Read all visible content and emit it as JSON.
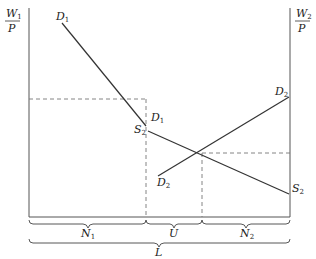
{
  "diagram": {
    "left_axis_label": {
      "num": "W",
      "num_sub": "1",
      "den": "P"
    },
    "right_axis_label": {
      "num": "W",
      "num_sub": "2",
      "den": "P"
    },
    "curves": [
      {
        "name": "D",
        "sub": "1",
        "label_top": "D1",
        "label_bottom": "D1"
      },
      {
        "name": "S",
        "sub": "2",
        "label_left": "S2",
        "label_right": "S2"
      },
      {
        "name": "D",
        "sub": "2",
        "label_left": "D2",
        "label_right": "D2"
      }
    ],
    "segments": {
      "n1": {
        "name": "N",
        "sub": "1"
      },
      "u": {
        "name": "U"
      },
      "n2": {
        "name": "N",
        "sub": "2"
      },
      "total": {
        "name": "L"
      }
    }
  }
}
